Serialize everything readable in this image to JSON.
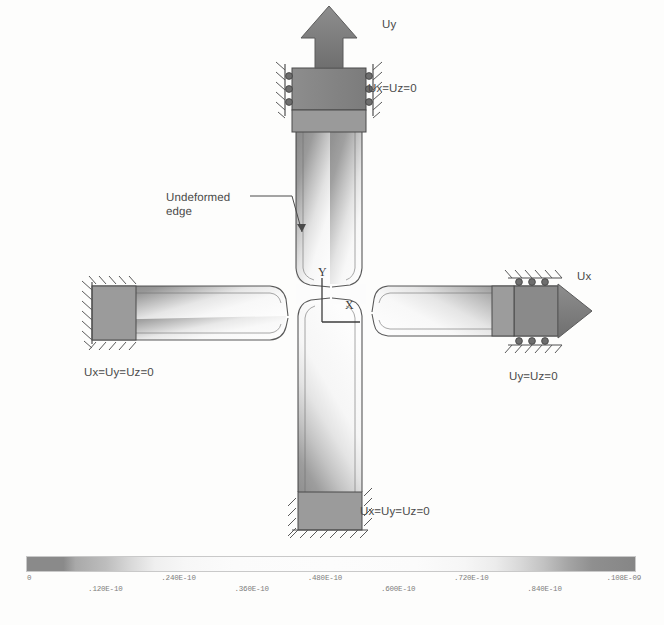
{
  "figure": {
    "kind": "fea-contour-plot",
    "annotations": {
      "load_uy": "Uy",
      "bc_top": "Ux=Uz=0",
      "load_ux": "Ux",
      "bc_right": "Uy=Uz=0",
      "bc_left": "Ux=Uy=Uz=0",
      "bc_bottom": "Ux=Uy=Uz=0",
      "undeformed_line1": "Undeformed",
      "undeformed_line2": "edge"
    },
    "axes": {
      "y_label": "Y",
      "x_label": "X"
    }
  },
  "chart_data": {
    "type": "heatmap",
    "title": "",
    "xlabel": "",
    "ylabel": "",
    "colorbar": {
      "orientation": "horizontal",
      "min": 0,
      "max": 1.08e-09,
      "tick_values": [
        0,
        1.2e-11,
        2.4e-11,
        3.6e-11,
        4.8e-11,
        6e-11,
        7.2e-11,
        8.4e-11,
        1.08e-09
      ],
      "tick_labels_row_a": [
        "0",
        ".240E-10",
        ".480E-10",
        ".720E-10",
        ".108E-09"
      ],
      "tick_labels_row_b": [
        ".120E-10",
        ".360E-10",
        ".600E-10",
        ".840E-10"
      ],
      "ticks": [
        {
          "label": "0",
          "pos_pct": 0.5,
          "row": "a"
        },
        {
          "label": ".120E-10",
          "pos_pct": 13.0,
          "row": "b"
        },
        {
          "label": ".240E-10",
          "pos_pct": 25.0,
          "row": "a"
        },
        {
          "label": ".360E-10",
          "pos_pct": 37.0,
          "row": "b"
        },
        {
          "label": ".480E-10",
          "pos_pct": 49.0,
          "row": "a"
        },
        {
          "label": ".600E-10",
          "pos_pct": 61.0,
          "row": "b"
        },
        {
          "label": ".720E-10",
          "pos_pct": 73.0,
          "row": "a"
        },
        {
          "label": ".840E-10",
          "pos_pct": 85.0,
          "row": "b"
        },
        {
          "label": ".108E-09",
          "pos_pct": 98.0,
          "row": "a"
        }
      ],
      "gradient_stops": [
        "#8a8a8a",
        "#bdbdbd",
        "#efefef",
        "#fcfcfc",
        "#efefef",
        "#bdbdbd",
        "#868686"
      ]
    },
    "arms": [
      {
        "name": "top-arm",
        "direction": "up",
        "loaded": true,
        "load": "Uy",
        "constraint": "Ux=Uz=0"
      },
      {
        "name": "right-arm",
        "direction": "right",
        "loaded": true,
        "load": "Ux",
        "constraint": "Uy=Uz=0"
      },
      {
        "name": "left-arm",
        "direction": "left",
        "loaded": false,
        "load": "",
        "constraint": "Ux=Uy=Uz=0"
      },
      {
        "name": "bottom-arm",
        "direction": "down",
        "loaded": false,
        "load": "",
        "constraint": "Ux=Uy=Uz=0"
      }
    ]
  },
  "caption": {
    "text": ""
  }
}
